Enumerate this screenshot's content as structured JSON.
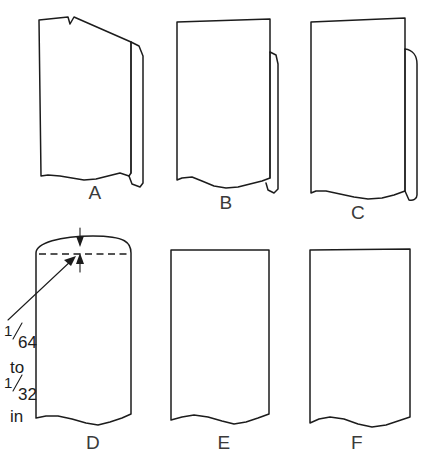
{
  "diagram": {
    "type": "technical-illustration",
    "background_color": "#ffffff",
    "line_color": "#1c1c1c",
    "label_color": "#3a3a3a",
    "figures": [
      {
        "id": "a",
        "label": "A",
        "label_x": 95,
        "label_y": 199,
        "description": "board with notched top edge and bevelled right edge"
      },
      {
        "id": "b",
        "label": "B",
        "label_x": 226,
        "label_y": 209,
        "description": "board with tapered top and narrow bevelled right edge"
      },
      {
        "id": "c",
        "label": "C",
        "label_x": 358,
        "label_y": 219,
        "description": "board with rounded right edge"
      },
      {
        "id": "d",
        "label": "D",
        "label_x": 93,
        "label_y": 449,
        "description": "board with crowned top edge and dimension callout"
      },
      {
        "id": "e",
        "label": "E",
        "label_x": 224,
        "label_y": 449,
        "description": "board with flat top edge"
      },
      {
        "id": "f",
        "label": "F",
        "label_x": 357,
        "label_y": 449,
        "description": "board with square flat top edge"
      }
    ],
    "annotation": {
      "target_figure": "D",
      "lines": [
        {
          "kind": "fraction",
          "numerator": "1",
          "denominator": "64"
        },
        {
          "kind": "word",
          "text": "to"
        },
        {
          "kind": "fraction",
          "numerator": "1",
          "denominator": "32"
        },
        {
          "kind": "word",
          "text": "in"
        }
      ],
      "full_text": "1/64 to 1/32 in",
      "numerator_1": "1",
      "denominator_1": "64",
      "connector": "to",
      "numerator_2": "1",
      "denominator_2": "32",
      "unit": "in"
    }
  }
}
